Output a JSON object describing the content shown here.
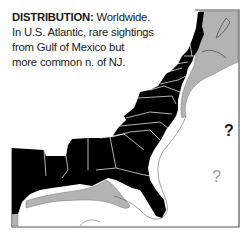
{
  "caption": {
    "label": "DISTRIBUTION:",
    "line1_rest": " Worldwide.",
    "line2": "In U.S. Atlantic, rare sightings",
    "line3": "from Gulf of Mexico but",
    "line4": "more common n. of NJ."
  },
  "map": {
    "region": "Eastern United States coastline and Gulf of Mexico",
    "land_color": "#000000",
    "range_color": "#b3b3b3",
    "water_color": "#ffffff",
    "frame_color": "#555555"
  },
  "markers": [
    {
      "text": "?",
      "style": "dark",
      "color": "#1a1a1a"
    },
    {
      "text": "?",
      "style": "light",
      "color": "#9a9a9a"
    }
  ]
}
